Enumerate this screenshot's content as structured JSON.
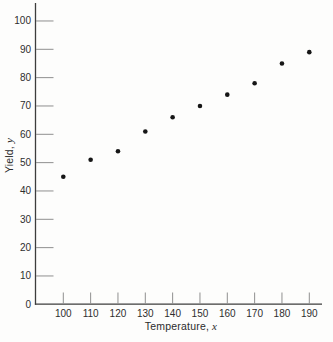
{
  "chart_data": {
    "type": "scatter",
    "title": "",
    "xlabel": "Temperature, x",
    "ylabel": "Yield, y",
    "labels": {
      "xlabel_prefix": "Temperature,",
      "xlabel_var": "x",
      "ylabel_prefix": "Yield,",
      "ylabel_var": "y"
    },
    "x": [
      100,
      110,
      120,
      130,
      140,
      150,
      160,
      170,
      180,
      190
    ],
    "y": [
      45,
      51,
      54,
      61,
      66,
      70,
      74,
      78,
      85,
      89
    ],
    "x_ticks": [
      100,
      110,
      120,
      130,
      140,
      150,
      160,
      170,
      180,
      190
    ],
    "y_ticks": [
      0,
      10,
      20,
      30,
      40,
      50,
      60,
      70,
      80,
      90,
      100
    ],
    "xlim": [
      89.7,
      195
    ],
    "ylim": [
      0,
      106.3
    ],
    "grid": false,
    "legend": false,
    "marker": "filled-circle",
    "tick_direction": "in",
    "colors": {
      "point": "#161616",
      "axis": "#3d3d3d",
      "tick": "#8f8f8f",
      "text": "#2e2e2e",
      "background": "#fdfdfc"
    }
  }
}
